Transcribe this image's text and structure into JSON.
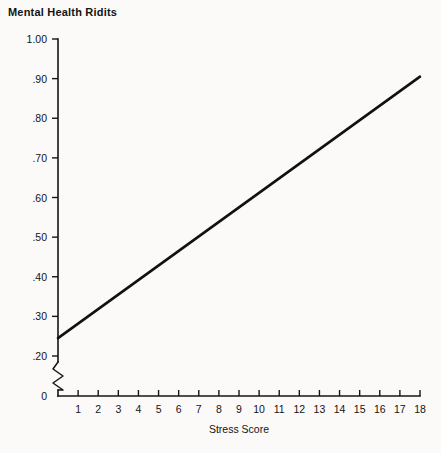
{
  "chart_data": {
    "type": "line",
    "title": "Mental Health Ridits",
    "xlabel": "Stress Score",
    "ylabel": "",
    "xlim": [
      0,
      18
    ],
    "ylim": [
      0,
      1.0
    ],
    "grid": false,
    "legend": null,
    "axis_break": {
      "axis": "y",
      "between": [
        0.0,
        0.2
      ],
      "style": "zigzag"
    },
    "y_ticks": [
      {
        "value": 1.0,
        "label": "1.00"
      },
      {
        "value": 0.9,
        "label": ".90"
      },
      {
        "value": 0.8,
        "label": ".80"
      },
      {
        "value": 0.7,
        "label": ".70"
      },
      {
        "value": 0.6,
        "label": ".60"
      },
      {
        "value": 0.5,
        "label": ".50"
      },
      {
        "value": 0.4,
        "label": ".40"
      },
      {
        "value": 0.3,
        "label": ".30"
      },
      {
        "value": 0.2,
        "label": ".20"
      },
      {
        "value": 0.0,
        "label": "0"
      }
    ],
    "x_ticks": [
      {
        "value": 1,
        "label": "1"
      },
      {
        "value": 2,
        "label": "2"
      },
      {
        "value": 3,
        "label": "3"
      },
      {
        "value": 4,
        "label": "4"
      },
      {
        "value": 5,
        "label": "5"
      },
      {
        "value": 6,
        "label": "6"
      },
      {
        "value": 7,
        "label": "7"
      },
      {
        "value": 8,
        "label": "8"
      },
      {
        "value": 9,
        "label": "9"
      },
      {
        "value": 10,
        "label": "10"
      },
      {
        "value": 11,
        "label": "11"
      },
      {
        "value": 12,
        "label": "12"
      },
      {
        "value": 13,
        "label": "13"
      },
      {
        "value": 14,
        "label": "14"
      },
      {
        "value": 15,
        "label": "15"
      },
      {
        "value": 16,
        "label": "16"
      },
      {
        "value": 17,
        "label": "17"
      },
      {
        "value": 18,
        "label": "18"
      }
    ],
    "series": [
      {
        "name": "Mental Health Ridits",
        "x": [
          0,
          18
        ],
        "values": [
          0.245,
          0.905
        ],
        "color": "#111111"
      }
    ]
  },
  "colors": {
    "background": "#fbfaf8",
    "ink": "#151515",
    "line": "#111111"
  }
}
